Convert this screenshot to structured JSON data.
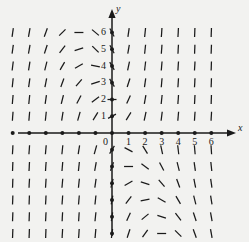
{
  "figure": {
    "kind": "direction-field",
    "background_color": "#f2f2f0",
    "ink_color": "#1a1a1a"
  },
  "axes": {
    "x_axis_label": "x",
    "y_axis_label": "y",
    "origin_label": "0",
    "x_tick_labels": [
      "1",
      "2",
      "3",
      "4",
      "5",
      "6"
    ],
    "y_tick_labels": [
      "1",
      "2",
      "3",
      "4",
      "5",
      "6"
    ]
  },
  "chart_data": {
    "type": "scatter",
    "title": "",
    "xlabel": "x",
    "ylabel": "y",
    "xlim": [
      -6.5,
      6.8
    ],
    "ylim": [
      -6.5,
      6.8
    ],
    "grid": false,
    "legend": "none",
    "x_ticks": [
      -6,
      -5,
      -4,
      -3,
      -2,
      -1,
      0,
      1,
      2,
      3,
      4,
      5,
      6
    ],
    "y_ticks": [
      1,
      2,
      3,
      4,
      5,
      6
    ],
    "x_tick_labels": [
      "",
      "",
      "",
      "",
      "",
      "",
      "0",
      "1",
      "2",
      "3",
      "4",
      "5",
      "6"
    ],
    "y_tick_labels": [
      "1",
      "2",
      "3",
      "4",
      "5",
      "6"
    ],
    "axis_dot_radius_px": 2.0,
    "grid_x": [
      -6,
      -5,
      -4,
      -3,
      -2,
      -1,
      0,
      1,
      2,
      3,
      4,
      5,
      6
    ],
    "grid_y": [
      6,
      5,
      4,
      3,
      2,
      1,
      -1,
      -2,
      -3,
      -4,
      -5,
      -6
    ],
    "tick_length_px": 9,
    "note": "Each grid node carries a short line segment whose tilt encodes the slope of a differential equation at that point.",
    "segment_angles_deg": [
      {
        "y": 6,
        "angles": [
          82,
          80,
          70,
          45,
          0,
          -40,
          -62,
          82,
          84,
          86,
          87,
          88,
          88
        ]
      },
      {
        "y": 5,
        "angles": [
          82,
          80,
          72,
          52,
          18,
          -45,
          -62,
          80,
          84,
          86,
          87,
          88,
          88
        ]
      },
      {
        "y": 4,
        "angles": [
          83,
          81,
          76,
          60,
          30,
          -12,
          -60,
          78,
          83,
          85,
          86,
          87,
          88
        ]
      },
      {
        "y": 3,
        "angles": [
          84,
          82,
          79,
          70,
          50,
          18,
          -58,
          72,
          82,
          85,
          86,
          87,
          88
        ]
      },
      {
        "y": 2,
        "angles": [
          85,
          84,
          82,
          76,
          62,
          36,
          0,
          66,
          80,
          84,
          86,
          87,
          88
        ]
      },
      {
        "y": 1,
        "angles": [
          86,
          85,
          84,
          81,
          74,
          58,
          28,
          58,
          78,
          83,
          85,
          86,
          87
        ]
      },
      {
        "y": -1,
        "angles": [
          87,
          86,
          85,
          84,
          81,
          74,
          58,
          -28,
          -58,
          -78,
          -83,
          -85,
          -86
        ]
      },
      {
        "y": -2,
        "angles": [
          88,
          87,
          86,
          85,
          84,
          80,
          70,
          0,
          -36,
          -62,
          -76,
          -82,
          -84
        ]
      },
      {
        "y": -3,
        "angles": [
          88,
          87,
          86,
          85,
          84,
          82,
          76,
          30,
          -18,
          -50,
          -70,
          -79,
          -82
        ]
      },
      {
        "y": -4,
        "angles": [
          88,
          88,
          87,
          86,
          85,
          84,
          80,
          52,
          12,
          -30,
          -60,
          -76,
          -81
        ]
      },
      {
        "y": -5,
        "angles": [
          88,
          88,
          87,
          87,
          86,
          84,
          82,
          66,
          40,
          -18,
          -52,
          -72,
          -80
        ]
      },
      {
        "y": -6,
        "angles": [
          88,
          88,
          88,
          87,
          86,
          85,
          83,
          72,
          55,
          0,
          -45,
          -70,
          -80
        ]
      }
    ]
  }
}
